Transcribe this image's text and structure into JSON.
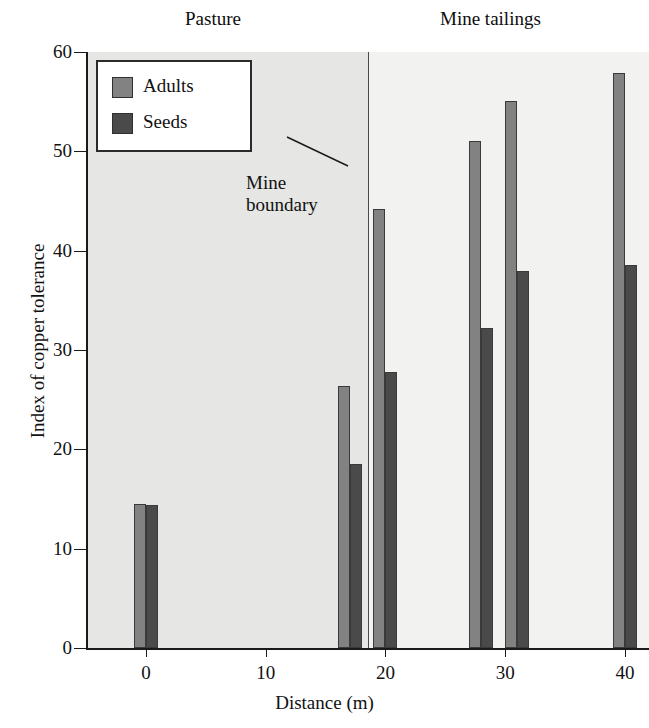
{
  "chart_data": {
    "type": "bar",
    "title": "",
    "xlabel": "Distance (m)",
    "ylabel": "Index of copper tolerance",
    "xlim": [
      -5,
      42
    ],
    "ylim": [
      0,
      60
    ],
    "xticks": [
      0,
      10,
      20,
      30,
      40
    ],
    "yticks": [
      0,
      10,
      20,
      30,
      40,
      50,
      60
    ],
    "grid": false,
    "legend_position": "top-left",
    "series": [
      {
        "name": "Adults",
        "color": "#828282",
        "points": [
          {
            "x": 0,
            "value": 14.5
          },
          {
            "x": 17,
            "value": 26.4
          },
          {
            "x": 20,
            "value": 44.2
          },
          {
            "x": 28,
            "value": 51.0
          },
          {
            "x": 31,
            "value": 55.1
          },
          {
            "x": 40,
            "value": 57.9
          }
        ]
      },
      {
        "name": "Seeds",
        "color": "#4a4a4a",
        "points": [
          {
            "x": 0,
            "value": 14.4
          },
          {
            "x": 17,
            "value": 18.5
          },
          {
            "x": 20,
            "value": 27.8
          },
          {
            "x": 28,
            "value": 32.2
          },
          {
            "x": 31,
            "value": 38.0
          },
          {
            "x": 40,
            "value": 38.6
          }
        ]
      }
    ],
    "regions": [
      {
        "label": "Pasture",
        "from": -5,
        "to": 18.5,
        "color": "#e6e6e4"
      },
      {
        "label": "Mine tailings",
        "from": 18.5,
        "to": 42,
        "color": "#f2f2f0"
      }
    ],
    "annotations": [
      {
        "name": "mine-boundary",
        "text": "Mine\nboundary",
        "line1": "Mine",
        "line2": "boundary",
        "at_x": 18.5
      }
    ]
  },
  "legend": {
    "items": [
      {
        "label": "Adults",
        "swatch": "adults"
      },
      {
        "label": "Seeds",
        "swatch": "seeds"
      }
    ]
  },
  "axes": {
    "y_title": "Index of copper tolerance",
    "x_title": "Distance (m)",
    "y_tick_labels": [
      "0",
      "10",
      "20",
      "30",
      "40",
      "50",
      "60"
    ],
    "x_tick_labels": [
      "0",
      "10",
      "20",
      "30",
      "40"
    ]
  },
  "regions": {
    "pasture": "Pasture",
    "tailings": "Mine tailings"
  },
  "annotation": {
    "line1": "Mine",
    "line2": "boundary"
  }
}
